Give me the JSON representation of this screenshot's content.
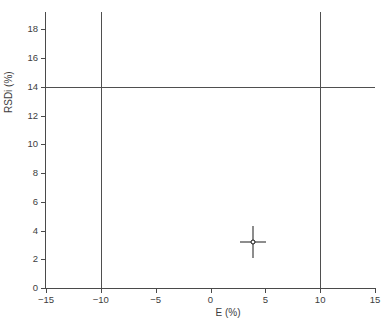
{
  "chart_data": {
    "type": "scatter",
    "title": "",
    "xlabel": "E (%)",
    "ylabel": "RSDi (%)",
    "xlim": [
      -15,
      15
    ],
    "ylim": [
      0,
      19.2
    ],
    "xticks": [
      -15,
      -10,
      -5,
      0,
      5,
      10,
      15
    ],
    "xticklabels": [
      "−15",
      "−10",
      "−5",
      "0",
      "5",
      "10",
      "15"
    ],
    "yticks": [
      0,
      2,
      4,
      6,
      8,
      10,
      12,
      14,
      16,
      18
    ],
    "yticklabels": [
      "0",
      "2",
      "4",
      "6",
      "8",
      "10",
      "12",
      "14",
      "16",
      "18"
    ],
    "grid": false,
    "legend": null,
    "series": [
      {
        "name": "measurement",
        "marker": "circle-open",
        "x": [
          3.9
        ],
        "y": [
          3.2
        ],
        "xerr": [
          1.2
        ],
        "yerr": [
          1.1
        ]
      }
    ],
    "reference_lines": [
      {
        "name": "acceptance-limit-lower-E",
        "orientation": "vertical",
        "value": -10
      },
      {
        "name": "acceptance-limit-upper-E",
        "orientation": "vertical",
        "value": 10
      },
      {
        "name": "acceptance-limit-rsdi",
        "orientation": "horizontal",
        "value": 14
      }
    ],
    "colors": {
      "axis": "#4a4a4a",
      "reference_line": "#4f4f4f",
      "marker": "#111111",
      "background": "#ffffff"
    }
  }
}
